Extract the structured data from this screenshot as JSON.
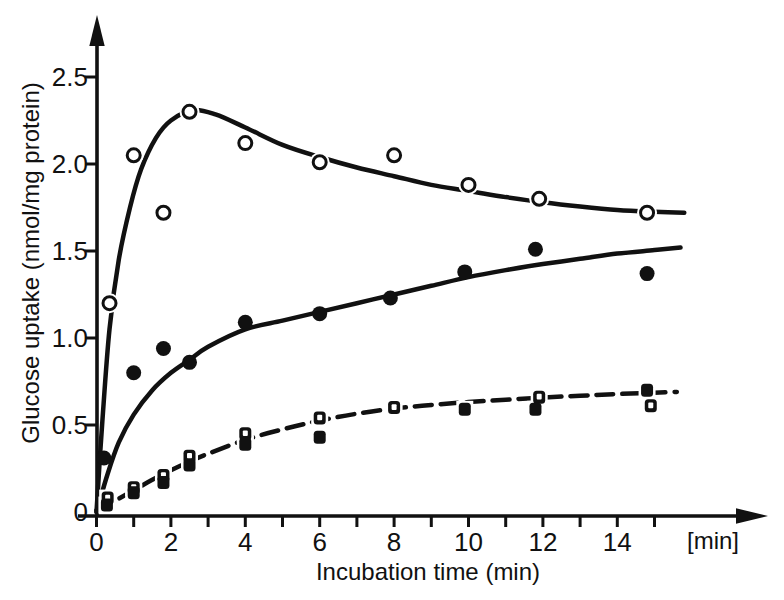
{
  "chart_data": {
    "type": "scatter",
    "title": "",
    "xlabel": "Incubation time (min)",
    "x_axis_end_label": "[min]",
    "ylabel": "Glucose uptake (nmol/mg protein)",
    "xlim": [
      0,
      16.5
    ],
    "ylim": [
      0,
      2.75
    ],
    "grid": false,
    "legend": "none",
    "x_ticks": {
      "values": [
        0,
        1,
        2,
        3,
        4,
        5,
        6,
        7,
        8,
        9,
        10,
        11,
        12,
        13,
        14,
        15
      ],
      "labeled_values": [
        0,
        2,
        4,
        6,
        8,
        10,
        12,
        14
      ],
      "labels": [
        "0",
        "2",
        "4",
        "6",
        "8",
        "10",
        "12",
        "14"
      ]
    },
    "y_ticks": {
      "values": [
        0,
        0.5,
        1.0,
        1.5,
        2.0,
        2.5
      ],
      "labels": [
        "0",
        "0.5",
        "1.0",
        "1.5",
        "2.0",
        "2.5"
      ]
    },
    "series": [
      {
        "name": "open-circles",
        "marker": "open-circle",
        "line": "solid",
        "points": [
          [
            0.35,
            1.2
          ],
          [
            1.0,
            2.05
          ],
          [
            1.8,
            1.72
          ],
          [
            2.5,
            2.3
          ],
          [
            4.0,
            2.12
          ],
          [
            6.0,
            2.01
          ],
          [
            8.0,
            2.05
          ],
          [
            10.0,
            1.88
          ],
          [
            11.9,
            1.8
          ],
          [
            14.8,
            1.72
          ]
        ],
        "trend": [
          [
            0,
            0
          ],
          [
            0.15,
            0.5
          ],
          [
            0.35,
            1.05
          ],
          [
            0.6,
            1.45
          ],
          [
            0.9,
            1.75
          ],
          [
            1.2,
            1.97
          ],
          [
            1.6,
            2.15
          ],
          [
            2.0,
            2.25
          ],
          [
            2.6,
            2.31
          ],
          [
            3.2,
            2.285
          ],
          [
            4,
            2.21
          ],
          [
            5,
            2.11
          ],
          [
            6,
            2.04
          ],
          [
            7,
            1.98
          ],
          [
            8,
            1.93
          ],
          [
            9,
            1.88
          ],
          [
            10,
            1.845
          ],
          [
            11,
            1.81
          ],
          [
            12,
            1.78
          ],
          [
            13,
            1.755
          ],
          [
            14,
            1.735
          ],
          [
            15,
            1.725
          ],
          [
            15.8,
            1.72
          ]
        ]
      },
      {
        "name": "filled-circles",
        "marker": "filled-circle",
        "line": "solid",
        "points": [
          [
            0.2,
            0.31
          ],
          [
            1.0,
            0.8
          ],
          [
            1.8,
            0.94
          ],
          [
            2.5,
            0.86
          ],
          [
            4.0,
            1.09
          ],
          [
            6.0,
            1.14
          ],
          [
            7.9,
            1.23
          ],
          [
            9.9,
            1.38
          ],
          [
            11.8,
            1.51
          ],
          [
            14.8,
            1.37
          ]
        ],
        "trend": [
          [
            0,
            0
          ],
          [
            0.3,
            0.22
          ],
          [
            0.6,
            0.4
          ],
          [
            1.0,
            0.56
          ],
          [
            1.5,
            0.7
          ],
          [
            2.0,
            0.8
          ],
          [
            2.5,
            0.875
          ],
          [
            3,
            0.95
          ],
          [
            4,
            1.05
          ],
          [
            5,
            1.1
          ],
          [
            6,
            1.15
          ],
          [
            7,
            1.2
          ],
          [
            8,
            1.25
          ],
          [
            9,
            1.3
          ],
          [
            10,
            1.35
          ],
          [
            11,
            1.39
          ],
          [
            12,
            1.425
          ],
          [
            13,
            1.455
          ],
          [
            14,
            1.485
          ],
          [
            15,
            1.505
          ],
          [
            15.7,
            1.52
          ]
        ]
      },
      {
        "name": "open-squares",
        "marker": "open-square",
        "line": "dashed",
        "points": [
          [
            0.3,
            0.08
          ],
          [
            1.0,
            0.14
          ],
          [
            1.8,
            0.21
          ],
          [
            2.5,
            0.32
          ],
          [
            4.0,
            0.45
          ],
          [
            6.0,
            0.54
          ],
          [
            8.0,
            0.6
          ],
          [
            11.9,
            0.66
          ],
          [
            14.9,
            0.61
          ]
        ],
        "trend": [
          [
            0,
            0.01
          ],
          [
            0.5,
            0.065
          ],
          [
            1,
            0.125
          ],
          [
            1.5,
            0.185
          ],
          [
            2,
            0.24
          ],
          [
            2.5,
            0.29
          ],
          [
            3,
            0.335
          ],
          [
            4,
            0.415
          ],
          [
            5,
            0.475
          ],
          [
            6,
            0.525
          ],
          [
            7,
            0.565
          ],
          [
            8,
            0.595
          ],
          [
            9,
            0.615
          ],
          [
            10,
            0.632
          ],
          [
            11,
            0.645
          ],
          [
            12,
            0.658
          ],
          [
            13,
            0.668
          ],
          [
            14,
            0.678
          ],
          [
            15.6,
            0.69
          ]
        ]
      },
      {
        "name": "filled-squares",
        "marker": "filled-square",
        "line": "none",
        "points": [
          [
            0.28,
            0.04
          ],
          [
            1.0,
            0.11
          ],
          [
            1.8,
            0.17
          ],
          [
            2.5,
            0.27
          ],
          [
            4.0,
            0.39
          ],
          [
            6.0,
            0.43
          ],
          [
            9.9,
            0.59
          ],
          [
            11.8,
            0.59
          ],
          [
            14.8,
            0.7
          ]
        ]
      }
    ]
  },
  "colors": {
    "ink": "#111111",
    "background": "#ffffff"
  }
}
